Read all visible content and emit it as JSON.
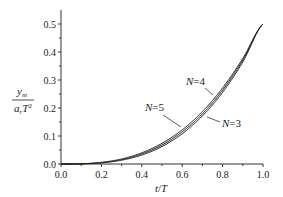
{
  "chart_data": {
    "type": "line",
    "title": "",
    "xlabel": "t/T",
    "ylabel": "y_m / (a_r T^2)",
    "xlim": [
      0.0,
      1.0
    ],
    "ylim": [
      0.0,
      0.5
    ],
    "xticks": [
      "0.0",
      "0.2",
      "0.4",
      "0.6",
      "0.8",
      "1.0"
    ],
    "yticks": [
      "0.0",
      "0.1",
      "0.2",
      "0.3",
      "0.4",
      "0.5"
    ],
    "grid": false,
    "legend": "inline annotations",
    "x": [
      0.0,
      0.1,
      0.2,
      0.3,
      0.4,
      0.5,
      0.6,
      0.7,
      0.8,
      0.9,
      1.0
    ],
    "series": [
      {
        "name": "N=3",
        "values": [
          0.0,
          0.0005,
          0.004,
          0.0135,
          0.032,
          0.0625,
          0.108,
          0.1715,
          0.256,
          0.3645,
          0.5
        ]
      },
      {
        "name": "N=4",
        "values": [
          0.0,
          0.0008,
          0.006,
          0.018,
          0.04,
          0.074,
          0.122,
          0.187,
          0.272,
          0.377,
          0.5
        ]
      },
      {
        "name": "N=5",
        "values": [
          0.0,
          0.0006,
          0.005,
          0.0155,
          0.036,
          0.068,
          0.115,
          0.179,
          0.264,
          0.371,
          0.5
        ]
      }
    ],
    "annotations": [
      {
        "text": "N=4",
        "x": 0.62,
        "y": 0.24
      },
      {
        "text": "N=5",
        "x": 0.4,
        "y": 0.19
      },
      {
        "text": "N=3",
        "x": 0.85,
        "y": 0.15
      }
    ]
  },
  "labels": {
    "xlabel_t": "t",
    "xlabel_T": "T",
    "ylabel_num": "y",
    "ylabel_num_sub": "m",
    "ylabel_den": "a",
    "ylabel_den_sub": "r",
    "ylabel_den_T": "T",
    "ylabel_den_sup": "2",
    "n4": "N=4",
    "n5": "N=5",
    "n3": "N=3"
  }
}
